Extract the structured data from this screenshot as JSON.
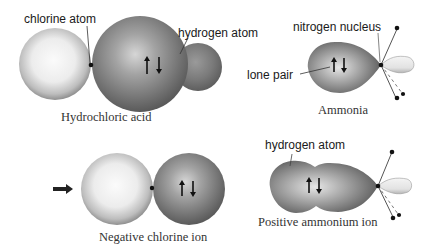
{
  "diagram": {
    "panels": [
      {
        "id": "hydrochloric-acid",
        "caption": "Hydrochloric acid",
        "labels": [
          "chlorine atom",
          "hydrogen atom"
        ]
      },
      {
        "id": "ammonia",
        "caption": "Ammonia",
        "labels": [
          "nitrogen nucleus",
          "lone pair"
        ]
      },
      {
        "id": "negative-chlorine-ion",
        "caption": "Negative chlorine ion",
        "labels": []
      },
      {
        "id": "positive-ammonium-ion",
        "caption": "Positive ammonium ion",
        "labels": [
          "hydrogen atom"
        ]
      }
    ],
    "symbols": {
      "electron_pair": "↑↓",
      "arrow": "right-arrow"
    },
    "colors": {
      "background": "#ffffff",
      "light_sphere": "#e8e8e8",
      "dark_sphere": "#6e6e6e",
      "line": "#333333"
    }
  }
}
